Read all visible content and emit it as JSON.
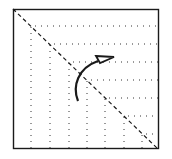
{
  "diagram": {
    "type": "origami-fold",
    "colors": {
      "ink": "#1a1a1a",
      "paper": "#ffffff"
    },
    "square": {
      "x": 13,
      "y": 9,
      "size": 146
    },
    "fold_line": {
      "x1": 13,
      "y1": 9,
      "x2": 158,
      "y2": 149,
      "style": "dashed"
    },
    "dotted_corners": [
      {
        "x": 31,
        "y": 26
      },
      {
        "x": 50,
        "y": 44
      },
      {
        "x": 69,
        "y": 62
      },
      {
        "x": 87,
        "y": 80
      },
      {
        "x": 105,
        "y": 98
      },
      {
        "x": 124,
        "y": 116
      },
      {
        "x": 142,
        "y": 134
      }
    ],
    "arrow": {
      "direction": "fold-up-right",
      "label": ""
    }
  }
}
